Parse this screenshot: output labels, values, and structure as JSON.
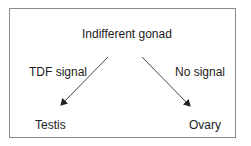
{
  "diagram": {
    "root": {
      "label": "Indifferent gonad"
    },
    "branches": [
      {
        "edge_label": "TDF signal",
        "target": "Testis"
      },
      {
        "edge_label": "No signal",
        "target": "Ovary"
      }
    ],
    "colors": {
      "border": "#8a8a8a",
      "arrow": "#333333",
      "text": "#1c1c1c"
    }
  }
}
